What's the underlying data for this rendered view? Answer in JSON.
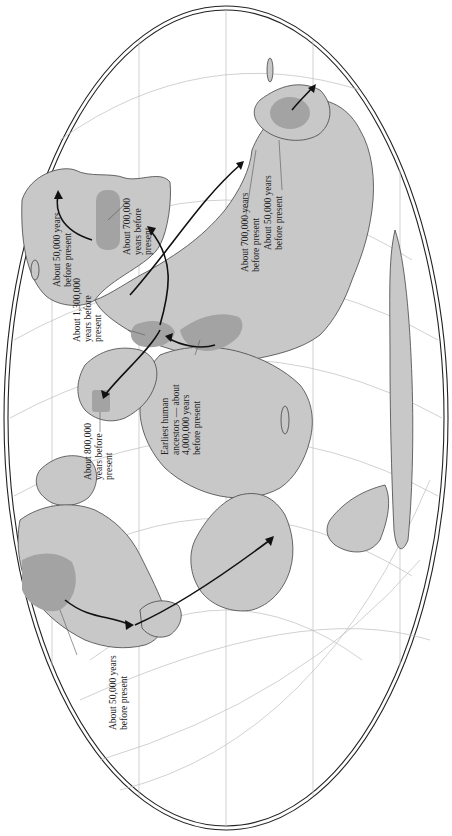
{
  "map": {
    "title": "Early human migration routes",
    "projection": "elliptical world map (rotated 90°)",
    "colors": {
      "land": "#c8c8c8",
      "origin_region": "#a0a0a0",
      "coast": "#444444",
      "graticule": "#b8b8b8",
      "border": "#222222",
      "arrow": "#111111",
      "background": "#ffffff"
    }
  },
  "labels": [
    {
      "id": "australia-50000",
      "lines": [
        "About 50,000 years",
        "before present"
      ]
    },
    {
      "id": "se-asia-700000",
      "lines": [
        "About 700,000",
        "years before",
        "present"
      ]
    },
    {
      "id": "east-asia-700000",
      "lines": [
        "About 700,000 years",
        "before present"
      ]
    },
    {
      "id": "east-asia-50000",
      "lines": [
        "About 50,000 years",
        "before present"
      ]
    },
    {
      "id": "mideast-1300000",
      "lines": [
        "About 1,300,000",
        "years before",
        "present"
      ]
    },
    {
      "id": "africa-4000000",
      "lines": [
        "Earliest human",
        "ancestors — about",
        "4,000,000 years",
        "before present"
      ]
    },
    {
      "id": "europe-800000",
      "lines": [
        "About 800,000",
        "years before",
        "present"
      ]
    },
    {
      "id": "americas-50000",
      "lines": [
        "About 50,000 years",
        "before present"
      ]
    }
  ]
}
